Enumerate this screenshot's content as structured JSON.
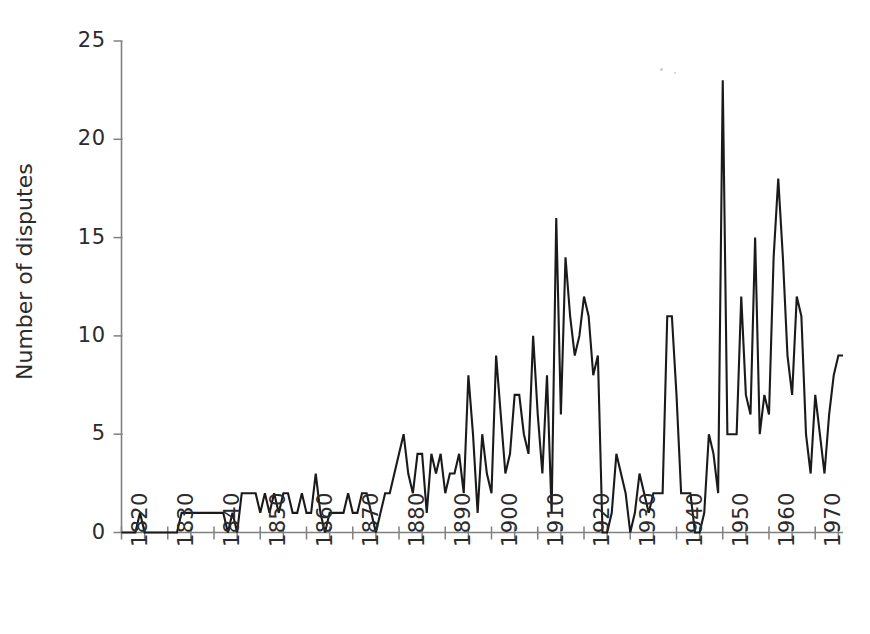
{
  "figure": {
    "background_color": "#ffffff",
    "line_color": "#1a1a1a",
    "axis_color": "#808080",
    "text_color": "#2b2b2b"
  },
  "axes": {
    "y_title": "Number of disputes",
    "y_ticks": [
      "0",
      "5",
      "10",
      "15",
      "20",
      "25"
    ],
    "x_ticks": [
      "1820",
      "1830",
      "1840",
      "1850",
      "1860",
      "1870",
      "1880",
      "1890",
      "1900",
      "1910",
      "1920",
      "1930",
      "1940",
      "1950",
      "1960",
      "1970"
    ]
  },
  "chart_data": {
    "type": "line",
    "title": "",
    "subtitle": "",
    "xlabel": "",
    "ylabel": "Number of disputes",
    "xlim": [
      1820,
      1976
    ],
    "ylim": [
      0,
      25
    ],
    "ytick_values": [
      0,
      5,
      10,
      15,
      20,
      25
    ],
    "xtick_values": [
      1820,
      1830,
      1840,
      1850,
      1860,
      1870,
      1880,
      1890,
      1900,
      1910,
      1920,
      1930,
      1940,
      1950,
      1960,
      1970
    ],
    "xminor_tick_step": 5,
    "grid": false,
    "legend": null,
    "legend_position": "none",
    "annotations": [],
    "series": [
      {
        "name": "Number of disputes",
        "color": "#1a1a1a",
        "x": [
          1820,
          1821,
          1822,
          1823,
          1824,
          1825,
          1826,
          1827,
          1828,
          1829,
          1830,
          1831,
          1832,
          1833,
          1834,
          1835,
          1836,
          1837,
          1838,
          1839,
          1840,
          1841,
          1842,
          1843,
          1844,
          1845,
          1846,
          1847,
          1848,
          1849,
          1850,
          1851,
          1852,
          1853,
          1854,
          1855,
          1856,
          1857,
          1858,
          1859,
          1860,
          1861,
          1862,
          1863,
          1864,
          1865,
          1866,
          1867,
          1868,
          1869,
          1870,
          1871,
          1872,
          1873,
          1874,
          1875,
          1876,
          1877,
          1878,
          1879,
          1880,
          1881,
          1882,
          1883,
          1884,
          1885,
          1886,
          1887,
          1888,
          1889,
          1890,
          1891,
          1892,
          1893,
          1894,
          1895,
          1896,
          1897,
          1898,
          1899,
          1900,
          1901,
          1902,
          1903,
          1904,
          1905,
          1906,
          1907,
          1908,
          1909,
          1910,
          1911,
          1912,
          1913,
          1914,
          1915,
          1916,
          1917,
          1918,
          1919,
          1920,
          1921,
          1922,
          1923,
          1924,
          1925,
          1926,
          1927,
          1928,
          1929,
          1930,
          1931,
          1932,
          1933,
          1934,
          1935,
          1936,
          1937,
          1938,
          1939,
          1940,
          1941,
          1942,
          1943,
          1944,
          1945,
          1946,
          1947,
          1948,
          1949,
          1950,
          1951,
          1952,
          1953,
          1954,
          1955,
          1956,
          1957,
          1958,
          1959,
          1960,
          1961,
          1962,
          1963,
          1964,
          1965,
          1966,
          1967,
          1968,
          1969,
          1970,
          1971,
          1972,
          1973,
          1974,
          1975,
          1976
        ],
        "values": [
          0,
          0,
          0,
          0,
          1,
          0,
          0,
          0,
          0,
          0,
          0,
          0,
          0,
          1,
          1,
          1,
          1,
          1,
          1,
          1,
          1,
          1,
          1,
          0,
          1,
          0,
          2,
          2,
          2,
          2,
          1,
          2,
          1,
          2,
          1,
          2,
          2,
          1,
          1,
          2,
          1,
          1,
          3,
          1,
          0,
          1,
          1,
          1,
          1,
          2,
          1,
          1,
          2,
          2,
          1,
          0,
          1,
          2,
          2,
          3,
          4,
          5,
          3,
          2,
          4,
          4,
          1,
          4,
          3,
          4,
          2,
          3,
          3,
          4,
          2,
          8,
          5,
          1,
          5,
          3,
          2,
          9,
          6,
          3,
          4,
          7,
          7,
          5,
          4,
          10,
          6,
          3,
          8,
          1,
          16,
          6,
          14,
          11,
          9,
          10,
          12,
          11,
          8,
          9,
          0,
          0,
          1,
          4,
          3,
          2,
          0,
          1,
          3,
          2,
          1,
          2,
          2,
          2,
          11,
          11,
          7,
          2,
          2,
          2,
          0,
          0,
          1,
          5,
          4,
          2,
          23,
          5,
          5,
          5,
          12,
          7,
          6,
          15,
          5,
          7,
          6,
          14,
          18,
          14,
          9,
          7,
          12,
          11,
          5,
          3,
          7,
          5,
          3,
          6,
          8,
          9,
          9
        ]
      }
    ]
  },
  "artifacts": [
    {
      "name": "scan-speck",
      "x": 660,
      "y": 68,
      "size": 3
    },
    {
      "name": "scan-speck",
      "x": 674,
      "y": 72,
      "size": 2
    }
  ]
}
